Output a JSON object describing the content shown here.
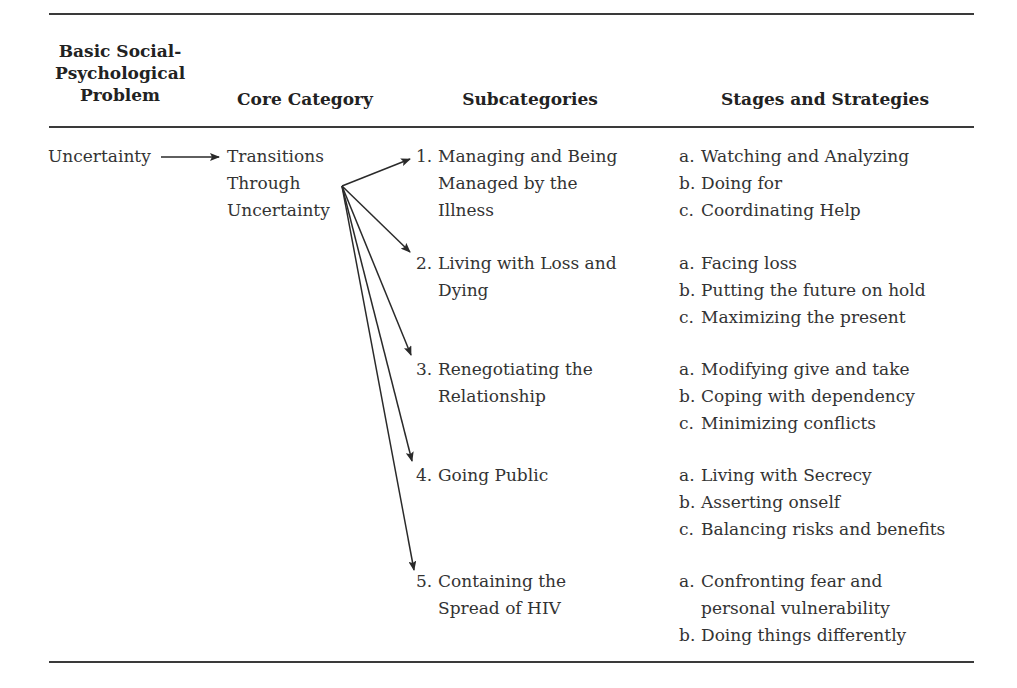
{
  "headers": {
    "problem": [
      "Basic Social-",
      "Psychological",
      "Problem"
    ],
    "core": "Core Category",
    "subcategories": "Subcategories",
    "stages": "Stages and Strategies"
  },
  "problem": "Uncertainty",
  "core": [
    "Transitions",
    "Through",
    "Uncertainty"
  ],
  "subcategories": [
    {
      "num": "1.",
      "lines": [
        "Managing and Being",
        "Managed by the",
        "Illness"
      ],
      "stages": [
        [
          "a.",
          "Watching and Analyzing"
        ],
        [
          "b.",
          "Doing for"
        ],
        [
          "c.",
          "Coordinating Help"
        ]
      ]
    },
    {
      "num": "2.",
      "lines": [
        "Living with Loss and",
        "Dying"
      ],
      "stages": [
        [
          "a.",
          "Facing loss"
        ],
        [
          "b.",
          "Putting the future on hold"
        ],
        [
          "c.",
          "Maximizing the present"
        ]
      ]
    },
    {
      "num": "3.",
      "lines": [
        "Renegotiating the",
        "Relationship"
      ],
      "stages": [
        [
          "a.",
          "Modifying give and take"
        ],
        [
          "b.",
          "Coping with dependency"
        ],
        [
          "c.",
          "Minimizing conflicts"
        ]
      ]
    },
    {
      "num": "4.",
      "lines": [
        "Going Public"
      ],
      "stages": [
        [
          "a.",
          "Living with Secrecy"
        ],
        [
          "b.",
          "Asserting onself"
        ],
        [
          "c.",
          "Balancing risks and benefits"
        ]
      ]
    },
    {
      "num": "5.",
      "lines": [
        "Containing the",
        "Spread of HIV"
      ],
      "stages": [
        [
          "a.",
          "Confronting fear and"
        ],
        [
          "",
          "personal vulnerability"
        ],
        [
          "b.",
          "Doing things differently"
        ]
      ]
    }
  ],
  "colors": {
    "text": "#333333",
    "rule": "#3a3a3a"
  }
}
